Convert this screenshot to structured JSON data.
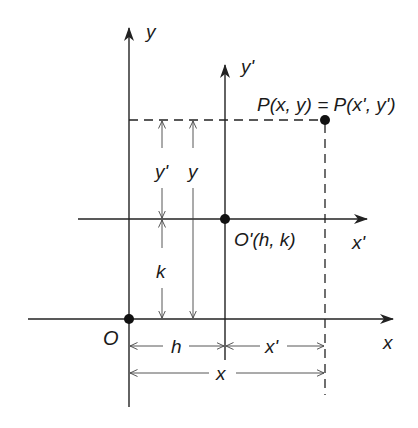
{
  "diagram": {
    "axes": {
      "x_label": "x",
      "y_label": "y",
      "x_prime_label": "x'",
      "y_prime_label": "y'"
    },
    "points": {
      "origin_label": "O",
      "new_origin_label": "O'(h, k)",
      "point_label": "P(x, y) = P(x', y')"
    },
    "dimensions": {
      "y_prime": "y'",
      "y": "y",
      "k": "k",
      "h": "h",
      "x_prime": "x'",
      "x": "x"
    },
    "colors": {
      "ink": "#222222",
      "background": "#ffffff"
    }
  }
}
